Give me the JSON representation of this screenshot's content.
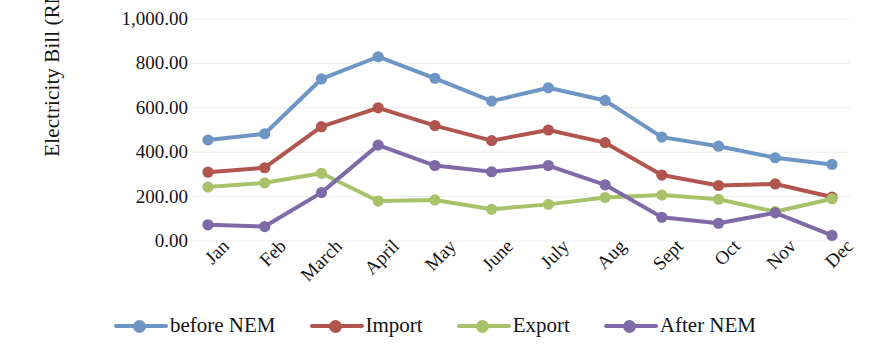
{
  "chart_data": {
    "type": "line",
    "title": "",
    "xlabel": "",
    "ylabel": "Electricity Bill (RM)",
    "ylim": [
      0,
      1000
    ],
    "ytick_values": [
      1000,
      800,
      600,
      400,
      200,
      0
    ],
    "ytick_labels": [
      "1,000.00",
      "800.00",
      "600.00",
      "400.00",
      "200.00",
      "0.00"
    ],
    "grid": true,
    "legend_position": "bottom",
    "categories": [
      "Jan",
      "Feb",
      "March",
      "April",
      "May",
      "June",
      "July",
      "Aug",
      "Sept",
      "Oct",
      "Nov",
      "Dec"
    ],
    "series": [
      {
        "name": "before NEM",
        "color": "#6E96C4",
        "values": [
          455,
          483,
          730,
          830,
          733,
          630,
          690,
          633,
          468,
          427,
          375,
          345
        ]
      },
      {
        "name": "Import",
        "color": "#B1564F",
        "values": [
          310,
          330,
          515,
          600,
          520,
          452,
          500,
          443,
          297,
          250,
          257,
          198
        ]
      },
      {
        "name": "Export",
        "color": "#A9C26A",
        "values": [
          243,
          262,
          305,
          180,
          185,
          143,
          165,
          196,
          207,
          188,
          132,
          190
        ]
      },
      {
        "name": "After NEM",
        "color": "#7E6AA6",
        "values": [
          73,
          65,
          218,
          432,
          340,
          312,
          340,
          253,
          107,
          80,
          127,
          25
        ]
      }
    ]
  },
  "axis": {
    "y_title": "Electricity Bill (RM)"
  }
}
